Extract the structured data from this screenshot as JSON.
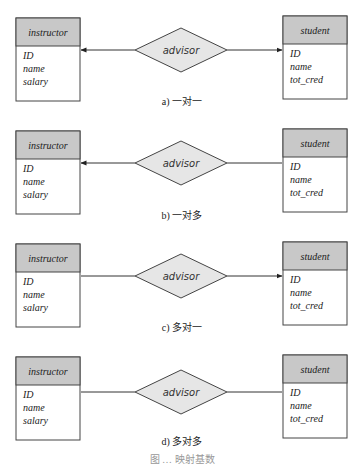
{
  "diagrams": [
    {
      "id": "a",
      "caption": "a) 一对一",
      "left_entity": {
        "name": "instructor",
        "attributes": [
          "ID",
          "name",
          "salary"
        ]
      },
      "relationship": "advisor",
      "right_entity": {
        "name": "student",
        "attributes": [
          "ID",
          "name",
          "tot_cred"
        ]
      },
      "left_arrow": true,
      "right_arrow": true
    },
    {
      "id": "b",
      "caption": "b) 一对多",
      "left_entity": {
        "name": "instructor",
        "attributes": [
          "ID",
          "name",
          "salary"
        ]
      },
      "relationship": "advisor",
      "right_entity": {
        "name": "student",
        "attributes": [
          "ID",
          "name",
          "tot_cred"
        ]
      },
      "left_arrow": true,
      "right_arrow": false
    },
    {
      "id": "c",
      "caption": "c) 多对一",
      "left_entity": {
        "name": "instructor",
        "attributes": [
          "ID",
          "name",
          "salary"
        ]
      },
      "relationship": "advisor",
      "right_entity": {
        "name": "student",
        "attributes": [
          "ID",
          "name",
          "tot_cred"
        ]
      },
      "left_arrow": false,
      "right_arrow": true
    },
    {
      "id": "d",
      "caption": "d) 多对多",
      "left_entity": {
        "name": "instructor",
        "attributes": [
          "ID",
          "name",
          "salary"
        ]
      },
      "relationship": "advisor",
      "right_entity": {
        "name": "student",
        "attributes": [
          "ID",
          "name",
          "tot_cred"
        ]
      },
      "left_arrow": false,
      "right_arrow": false
    }
  ],
  "figure_caption": "图 … 映射基数",
  "colors": {
    "entity_header": "#c8c8c8",
    "relationship_fill": "#e6e6e6",
    "stroke": "#444444"
  }
}
